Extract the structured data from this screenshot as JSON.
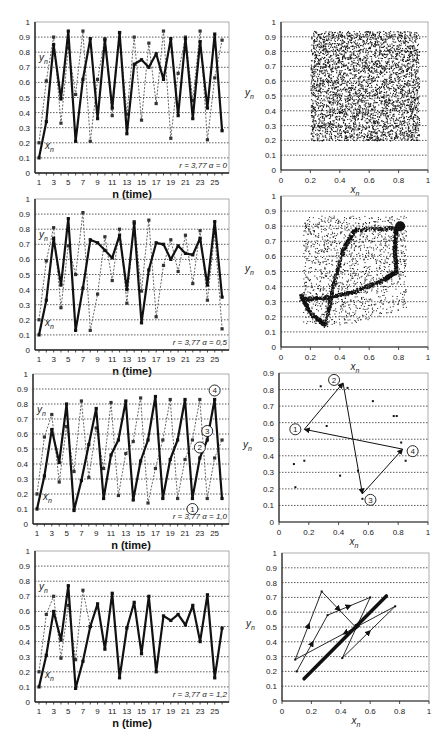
{
  "chart_data": [
    {
      "type": "line",
      "panel": "row1-left",
      "xlabel": "n (time)",
      "ylabel": "",
      "ylim": [
        0,
        1
      ],
      "yticks": [
        "0",
        "0.1",
        "0.2",
        "0.3",
        "0.4",
        "0.5",
        "0.6",
        "0.7",
        "0.8",
        "0.9",
        "1"
      ],
      "xticks": [
        "1",
        "3",
        "5",
        "7",
        "9",
        "11",
        "13",
        "15",
        "17",
        "19",
        "21",
        "23",
        "25"
      ],
      "grid": "horizontal dotted",
      "annotation": "r = 3,77   α = 0",
      "series": [
        {
          "name": "x_n",
          "style": "solid thick",
          "x": [
            1,
            2,
            3,
            4,
            5,
            6,
            7,
            8,
            9,
            10,
            11,
            12,
            13,
            14,
            15,
            16,
            17,
            18,
            19,
            20,
            21,
            22,
            23,
            24,
            25,
            26
          ],
          "values": [
            0.1,
            0.34,
            0.85,
            0.49,
            0.94,
            0.21,
            0.62,
            0.89,
            0.36,
            0.88,
            0.43,
            0.93,
            0.26,
            0.72,
            0.75,
            0.7,
            0.79,
            0.62,
            0.89,
            0.38,
            0.89,
            0.36,
            0.87,
            0.43,
            0.92,
            0.28
          ]
        },
        {
          "name": "y_n",
          "style": "dotted thin",
          "x": [
            1,
            2,
            3,
            4,
            5,
            6,
            7,
            8,
            9,
            10,
            11,
            12,
            13,
            14,
            15,
            16,
            17,
            18,
            19,
            20,
            21,
            22,
            23,
            24,
            25,
            26
          ],
          "values": [
            0.2,
            0.61,
            0.9,
            0.33,
            0.83,
            0.52,
            0.94,
            0.21,
            0.62,
            0.89,
            0.38,
            0.93,
            0.39,
            0.9,
            0.35,
            0.86,
            0.46,
            0.94,
            0.23,
            0.66,
            0.9,
            0.48,
            0.94,
            0.22,
            0.63,
            0.88
          ]
        }
      ],
      "labels": {
        "y": "y_n",
        "x": "x_n"
      }
    },
    {
      "type": "scatter",
      "panel": "row1-right",
      "xlabel": "x_n",
      "ylabel": "y_n",
      "xlim": [
        0,
        1
      ],
      "ylim": [
        0,
        1
      ],
      "xticks": [
        "0",
        "0.2",
        "0.4",
        "0.6",
        "0.8",
        "1"
      ],
      "yticks": [
        "0",
        "0.1",
        "0.2",
        "0.3",
        "0.4",
        "0.5",
        "0.6",
        "0.7",
        "0.8",
        "0.9",
        "1"
      ],
      "description": "dense uniform cloud filling square x∈[0.2,0.94], y∈[0.2,0.94]",
      "region": {
        "x": [
          0.2,
          0.94
        ],
        "y": [
          0.2,
          0.94
        ]
      }
    },
    {
      "type": "line",
      "panel": "row2-left",
      "xlabel": "n (time)",
      "ylim": [
        0,
        1
      ],
      "yticks": [
        "0",
        "0.1",
        "0.2",
        "0.3",
        "0.4",
        "0.5",
        "0.6",
        "0.7",
        "0.8",
        "0.9",
        "1"
      ],
      "xticks": [
        "1",
        "3",
        "5",
        "7",
        "9",
        "11",
        "13",
        "15",
        "17",
        "19",
        "21",
        "23",
        "25"
      ],
      "annotation": "r = 3,77   α = 0,5",
      "series": [
        {
          "name": "x_n",
          "style": "solid thick",
          "x": [
            1,
            2,
            3,
            4,
            5,
            6,
            7,
            8,
            9,
            10,
            11,
            12,
            13,
            14,
            15,
            16,
            17,
            18,
            19,
            20,
            21,
            22,
            23,
            24,
            25,
            26
          ],
          "values": [
            0.1,
            0.33,
            0.74,
            0.43,
            0.87,
            0.13,
            0.41,
            0.73,
            0.71,
            0.66,
            0.61,
            0.76,
            0.4,
            0.84,
            0.18,
            0.53,
            0.71,
            0.7,
            0.6,
            0.69,
            0.64,
            0.63,
            0.74,
            0.43,
            0.85,
            0.35
          ]
        },
        {
          "name": "y_n",
          "style": "dotted thin",
          "x": [
            1,
            2,
            3,
            4,
            5,
            6,
            7,
            8,
            9,
            10,
            11,
            12,
            13,
            14,
            15,
            16,
            17,
            18,
            19,
            20,
            21,
            22,
            23,
            24,
            25,
            26
          ],
          "values": [
            0.2,
            0.59,
            0.81,
            0.28,
            0.69,
            0.5,
            0.91,
            0.13,
            0.37,
            0.75,
            0.46,
            0.8,
            0.31,
            0.85,
            0.39,
            0.86,
            0.22,
            0.56,
            0.73,
            0.52,
            0.76,
            0.44,
            0.79,
            0.33,
            0.77,
            0.14
          ]
        }
      ],
      "labels": {
        "y": "y_n",
        "x": "x_n"
      }
    },
    {
      "type": "scatter",
      "panel": "row2-right",
      "xlabel": "x_n",
      "ylabel": "y_n",
      "xlim": [
        0,
        1
      ],
      "ylim": [
        0,
        1
      ],
      "xticks": [
        "0",
        "0.2",
        "0.4",
        "0.6",
        "0.8",
        "1"
      ],
      "yticks": [
        "0",
        "0.1",
        "0.2",
        "0.3",
        "0.4",
        "0.5",
        "0.6",
        "0.7",
        "0.8",
        "0.9",
        "1"
      ],
      "description": "strange-attractor-like cloud with dense curved bands forming a loop between (0.13,0.32), (0.3,0.15), (0.78,0.78), (0.45,0.78)"
    },
    {
      "type": "line",
      "panel": "row3-left",
      "xlabel": "n (time)",
      "ylim": [
        0,
        1
      ],
      "yticks": [
        "0",
        "0.1",
        "0.2",
        "0.3",
        "0.4",
        "0.5",
        "0.6",
        "0.7",
        "0.8",
        "0.9",
        "1"
      ],
      "xticks": [
        "1",
        "3",
        "5",
        "7",
        "9",
        "11",
        "13",
        "15",
        "17",
        "19",
        "21",
        "23",
        "25"
      ],
      "annotation": "r = 3,77   α = 1,0",
      "series": [
        {
          "name": "x_n",
          "style": "solid thick",
          "x": [
            1,
            2,
            3,
            4,
            5,
            6,
            7,
            8,
            9,
            10,
            11,
            12,
            13,
            14,
            15,
            16,
            17,
            18,
            19,
            20,
            21,
            22,
            23,
            24,
            25,
            26
          ],
          "values": [
            0.1,
            0.32,
            0.63,
            0.41,
            0.8,
            0.09,
            0.29,
            0.53,
            0.77,
            0.17,
            0.46,
            0.56,
            0.82,
            0.16,
            0.42,
            0.56,
            0.85,
            0.17,
            0.43,
            0.56,
            0.83,
            0.17,
            0.44,
            0.56,
            0.83,
            0.17
          ]
        },
        {
          "name": "y_n",
          "style": "dotted thin",
          "x": [
            1,
            2,
            3,
            4,
            5,
            6,
            7,
            8,
            9,
            10,
            11,
            12,
            13,
            14,
            15,
            16,
            17,
            18,
            19,
            20,
            21,
            22,
            23,
            24,
            25,
            26
          ],
          "values": [
            0.2,
            0.58,
            0.73,
            0.28,
            0.65,
            0.35,
            0.82,
            0.31,
            0.64,
            0.37,
            0.81,
            0.19,
            0.47,
            0.55,
            0.84,
            0.14,
            0.37,
            0.56,
            0.83,
            0.17,
            0.43,
            0.56,
            0.83,
            0.17,
            0.44,
            0.56
          ]
        }
      ],
      "markers": [
        {
          "label": "1",
          "n": 22,
          "value": 0.1
        },
        {
          "label": "2",
          "n": 23,
          "value": 0.51
        },
        {
          "label": "3",
          "n": 24,
          "value": 0.62
        },
        {
          "label": "4",
          "n": 25,
          "value": 0.89
        }
      ],
      "labels": {
        "y": "y_n",
        "x": "x_n"
      }
    },
    {
      "type": "scatter",
      "panel": "row3-right",
      "xlabel": "x_n",
      "ylabel": "y_n",
      "xlim": [
        0,
        1
      ],
      "ylim": [
        0,
        0.9
      ],
      "xticks": [
        "0",
        "0.2",
        "0.4",
        "0.6",
        "0.8",
        "1"
      ],
      "yticks": [
        "0",
        "0.1",
        "0.2",
        "0.3",
        "0.4",
        "0.5",
        "0.6",
        "0.7",
        "0.8",
        "0.9"
      ],
      "points": [
        [
          0.1,
          0.35
        ],
        [
          0.11,
          0.21
        ],
        [
          0.17,
          0.37
        ],
        [
          0.28,
          0.82
        ],
        [
          0.32,
          0.58
        ],
        [
          0.41,
          0.28
        ],
        [
          0.46,
          0.81
        ],
        [
          0.53,
          0.31
        ],
        [
          0.56,
          0.14
        ],
        [
          0.63,
          0.73
        ],
        [
          0.77,
          0.64
        ],
        [
          0.79,
          0.64
        ],
        [
          0.82,
          0.48
        ],
        [
          0.85,
          0.37
        ]
      ],
      "cycle": [
        {
          "label": "1",
          "x": 0.17,
          "y": 0.56
        },
        {
          "label": "2",
          "x": 0.43,
          "y": 0.84
        },
        {
          "label": "3",
          "x": 0.56,
          "y": 0.17
        },
        {
          "label": "4",
          "x": 0.83,
          "y": 0.44
        }
      ],
      "arrows": [
        [
          1,
          2
        ],
        [
          2,
          3
        ],
        [
          3,
          4
        ],
        [
          4,
          1
        ]
      ]
    },
    {
      "type": "line",
      "panel": "row4-left",
      "xlabel": "n (time)",
      "ylim": [
        0,
        1
      ],
      "yticks": [
        "0",
        "0.1",
        "0.2",
        "0.3",
        "0.4",
        "0.5",
        "0.6",
        "0.7",
        "0.8",
        "0.9",
        "1"
      ],
      "xticks": [
        "1",
        "3",
        "5",
        "7",
        "9",
        "11",
        "13",
        "15",
        "17",
        "19",
        "21",
        "23",
        "25"
      ],
      "annotation": "r = 3,77   α = 1,2",
      "series": [
        {
          "name": "x_n",
          "style": "solid thick",
          "x": [
            1,
            2,
            3,
            4,
            5,
            6,
            7,
            8,
            9,
            10,
            11,
            12,
            13,
            14,
            15,
            16,
            17,
            18,
            19,
            20,
            21,
            22,
            23,
            24,
            25,
            26
          ],
          "values": [
            0.1,
            0.31,
            0.6,
            0.41,
            0.77,
            0.09,
            0.27,
            0.5,
            0.65,
            0.35,
            0.72,
            0.16,
            0.49,
            0.66,
            0.32,
            0.7,
            0.2,
            0.57,
            0.54,
            0.58,
            0.51,
            0.64,
            0.4,
            0.71,
            0.16,
            0.49
          ]
        },
        {
          "name": "y_n",
          "style": "dotted thin",
          "x": [
            1,
            2,
            3,
            4,
            5,
            6,
            7,
            8
          ],
          "values": [
            0.2,
            0.58,
            0.7,
            0.29,
            0.64,
            0.28,
            0.74,
            0.5
          ]
        }
      ],
      "labels": {
        "y": "y_n",
        "x": "x_n"
      }
    },
    {
      "type": "line",
      "panel": "row4-right",
      "xlabel": "x_n",
      "ylabel": "y_n",
      "xlim": [
        0,
        1
      ],
      "ylim": [
        0,
        1
      ],
      "xticks": [
        "0",
        "0.2",
        "0.4",
        "0.6",
        "0.8",
        "1"
      ],
      "yticks": [
        "0",
        "0.1",
        "0.2",
        "0.3",
        "0.4",
        "0.5",
        "0.6",
        "0.7",
        "0.8",
        "0.9",
        "1"
      ],
      "diagonal": {
        "from": [
          0.15,
          0.15
        ],
        "to": [
          0.71,
          0.71
        ],
        "style": "thick"
      },
      "path": [
        [
          0.1,
          0.2
        ],
        [
          0.31,
          0.58
        ],
        [
          0.6,
          0.7
        ],
        [
          0.41,
          0.29
        ],
        [
          0.77,
          0.64
        ],
        [
          0.09,
          0.28
        ],
        [
          0.27,
          0.74
        ],
        [
          0.5,
          0.5
        ]
      ]
    }
  ],
  "labels": {
    "xtime": "n (time)",
    "yn": "y",
    "xn": "x",
    "sub": "n"
  }
}
